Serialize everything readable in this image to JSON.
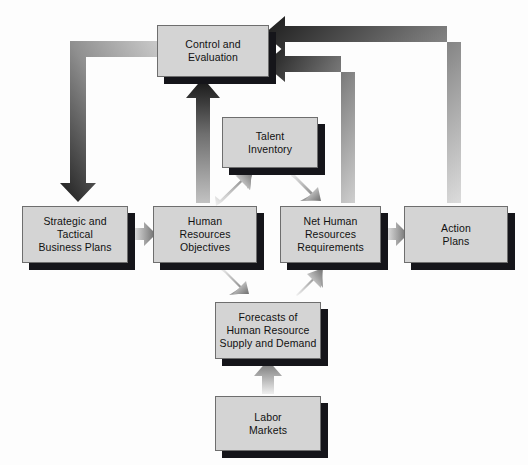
{
  "diagram": {
    "background_color": "#fdfdfd",
    "box_fill": "#d4d4d4",
    "box_border": "#6e6e6e",
    "shadow_color": "#15151a",
    "text_color": "#111111",
    "nodes": [
      {
        "id": "control",
        "label": "Control and\nEvaluation",
        "x": 157,
        "y": 25,
        "w": 112,
        "h": 52
      },
      {
        "id": "talent",
        "label": "Talent\nInventory",
        "x": 222,
        "y": 117,
        "w": 96,
        "h": 51
      },
      {
        "id": "strategic",
        "label": "Strategic and\nTactical\nBusiness Plans",
        "x": 22,
        "y": 206,
        "w": 106,
        "h": 57
      },
      {
        "id": "hrobj",
        "label": "Human\nResources\nObjectives",
        "x": 153,
        "y": 206,
        "w": 104,
        "h": 57
      },
      {
        "id": "netreq",
        "label": "Net Human\nResources\nRequirements",
        "x": 280,
        "y": 206,
        "w": 101,
        "h": 57
      },
      {
        "id": "action",
        "label": "Action\nPlans",
        "x": 404,
        "y": 206,
        "w": 104,
        "h": 57
      },
      {
        "id": "forecast",
        "label": "Forecasts of\nHuman Resource\nSupply and Demand",
        "x": 215,
        "y": 302,
        "w": 106,
        "h": 57
      },
      {
        "id": "labor",
        "label": "Labor\nMarkets",
        "x": 215,
        "y": 396,
        "w": 106,
        "h": 55
      }
    ],
    "connectors": [
      {
        "id": "control-to-strategic",
        "from": "control",
        "to": "strategic",
        "kind": "elbow-down-left",
        "style": "gradient-dark"
      },
      {
        "id": "hrobj-to-control",
        "from": "hrobj",
        "to": "control",
        "kind": "vertical-up",
        "style": "gradient-dark"
      },
      {
        "id": "netreq-to-control",
        "from": "netreq",
        "to": "control",
        "kind": "elbow-up-left",
        "style": "gradient-dark"
      },
      {
        "id": "action-to-control",
        "from": "action",
        "to": "control",
        "kind": "elbow-up-left",
        "style": "gradient-dark"
      },
      {
        "id": "strategic-to-hrobj",
        "from": "strategic",
        "to": "hrobj",
        "kind": "horizontal-right",
        "style": "gradient-gray"
      },
      {
        "id": "hrobj-to-talent",
        "from": "hrobj",
        "to": "talent",
        "kind": "diagonal-up-right",
        "style": "gradient-gray"
      },
      {
        "id": "talent-to-netreq",
        "from": "talent",
        "to": "netreq",
        "kind": "diagonal-down-right",
        "style": "gradient-gray"
      },
      {
        "id": "hrobj-to-forecast",
        "from": "hrobj",
        "to": "forecast",
        "kind": "diagonal-down-right",
        "style": "gradient-gray"
      },
      {
        "id": "forecast-to-netreq",
        "from": "forecast",
        "to": "netreq",
        "kind": "diagonal-up-right",
        "style": "gradient-gray"
      },
      {
        "id": "netreq-to-action",
        "from": "netreq",
        "to": "action",
        "kind": "horizontal-right",
        "style": "gradient-gray"
      },
      {
        "id": "labor-to-forecast",
        "from": "labor",
        "to": "forecast",
        "kind": "vertical-up",
        "style": "gradient-gray"
      }
    ]
  }
}
